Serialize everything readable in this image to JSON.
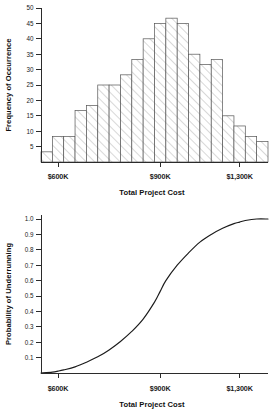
{
  "figures": {
    "histogram": {
      "name": "frequency-histogram",
      "xlabel": "Total Project Cost",
      "ylabel": "Frequency of Occurrence"
    },
    "scurve": {
      "name": "probability-s-curve",
      "xlabel": "Total Project Cost",
      "ylabel": "Probability of Underrunning"
    }
  },
  "chart_data": [
    {
      "type": "bar",
      "title": "",
      "xlabel": "Total Project Cost",
      "ylabel": "Frequency of Occurrence",
      "grid": false,
      "legend": null,
      "ylim": [
        0,
        50
      ],
      "yticks": [
        5,
        10,
        15,
        20,
        25,
        30,
        35,
        40,
        45,
        50
      ],
      "ytick_labels": [
        "5",
        "10",
        "15",
        "20",
        "25",
        "30",
        "35",
        "40",
        "45",
        "50"
      ],
      "xtick_labels": [
        "$600K",
        "$900K",
        "$1,300K"
      ],
      "xtick_positions": [
        1.5,
        10.5,
        17.5
      ],
      "xlim": [
        0,
        20
      ],
      "categories": [
        "bin-1",
        "bin-2",
        "bin-3",
        "bin-4",
        "bin-5",
        "bin-6",
        "bin-7",
        "bin-8",
        "bin-9",
        "bin-10",
        "bin-11",
        "bin-12",
        "bin-13",
        "bin-14",
        "bin-15",
        "bin-16",
        "bin-17",
        "bin-18",
        "bin-19",
        "bin-20"
      ],
      "values": [
        3.3,
        8.3,
        8.3,
        16.7,
        18.3,
        25,
        25,
        28.3,
        33.3,
        40,
        45,
        46.7,
        45,
        35,
        31.7,
        33.3,
        15,
        11.7,
        8.3,
        6.7
      ]
    },
    {
      "type": "line",
      "title": "",
      "xlabel": "Total Project Cost",
      "ylabel": "Probability of Underrunning",
      "grid": false,
      "legend": null,
      "ylim": [
        0,
        1.0
      ],
      "yticks": [
        0.1,
        0.2,
        0.3,
        0.4,
        0.5,
        0.6,
        0.7,
        0.8,
        0.9,
        1.0
      ],
      "ytick_labels": [
        "0.1",
        "0.2",
        "0.3",
        "0.4",
        "0.5",
        "0.6",
        "0.7",
        "0.8",
        "0.9",
        "1.0"
      ],
      "xtick_labels": [
        "$600K",
        "$900K",
        "$1,300K"
      ],
      "xtick_positions": [
        1.5,
        10.5,
        17.5
      ],
      "xlim": [
        0,
        20
      ],
      "x": [
        0,
        1,
        1.5,
        2,
        3,
        4,
        5,
        6,
        7,
        8,
        9,
        10,
        10.5,
        11,
        12,
        13,
        14,
        15,
        16,
        17,
        17.5,
        18,
        19,
        20
      ],
      "y": [
        0.0,
        0.006,
        0.012,
        0.02,
        0.04,
        0.07,
        0.105,
        0.15,
        0.205,
        0.27,
        0.35,
        0.46,
        0.53,
        0.6,
        0.7,
        0.78,
        0.85,
        0.9,
        0.94,
        0.97,
        0.98,
        0.99,
        1.0,
        1.0
      ]
    }
  ]
}
